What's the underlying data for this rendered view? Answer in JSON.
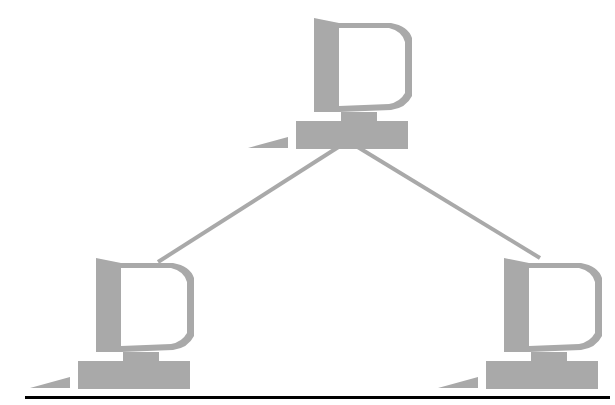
{
  "diagram": {
    "type": "network-topology",
    "colors": {
      "computer": "#a9a9a9",
      "link": "#a9a9a9",
      "baseline": "#000000",
      "background": "#ffffff"
    },
    "nodes": [
      {
        "id": "top",
        "icon": "computer-icon",
        "x": 296,
        "y": 18
      },
      {
        "id": "bottom-left",
        "icon": "computer-icon",
        "x": 78,
        "y": 258
      },
      {
        "id": "bottom-right",
        "icon": "computer-icon",
        "x": 486,
        "y": 258
      }
    ],
    "links": [
      {
        "from": "top",
        "to": "bottom-left"
      },
      {
        "from": "top",
        "to": "bottom-right"
      }
    ]
  }
}
